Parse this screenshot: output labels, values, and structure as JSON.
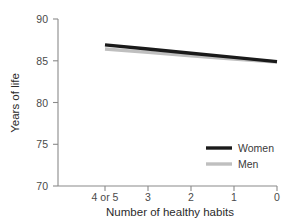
{
  "chart_data": {
    "type": "line",
    "title": "",
    "xlabel": "Number of healthy habits",
    "ylabel": "Years of life",
    "categories": [
      "4 or 5",
      "3",
      "2",
      "1",
      "0"
    ],
    "xtick_labels": [
      "4 or 5",
      "3",
      "2",
      "1",
      "0"
    ],
    "ytick_labels": [
      "90",
      "85",
      "80",
      "75",
      "70"
    ],
    "ylim": [
      70,
      90
    ],
    "yticks": [
      70,
      75,
      80,
      85,
      90
    ],
    "grid": false,
    "legend_position": "lower-right",
    "series": [
      {
        "name": "Women",
        "color": "#1a1a1a",
        "values": [
          86.9,
          86.4,
          85.9,
          85.4,
          84.9
        ]
      },
      {
        "name": "Men",
        "color": "#bfbfbf",
        "values": [
          86.4,
          86.0,
          85.6,
          85.2,
          84.85
        ]
      }
    ],
    "legend": [
      {
        "label": "Women",
        "color": "#1a1a1a"
      },
      {
        "label": "Men",
        "color": "#bfbfbf"
      }
    ]
  },
  "axes": {
    "y_title": "Years of life",
    "x_title": "Number of healthy habits"
  },
  "colors": {
    "axis": "#8a8a8a",
    "text": "#3d3d3d",
    "women": "#1a1a1a",
    "men": "#bfbfbf",
    "background": "#ffffff"
  }
}
